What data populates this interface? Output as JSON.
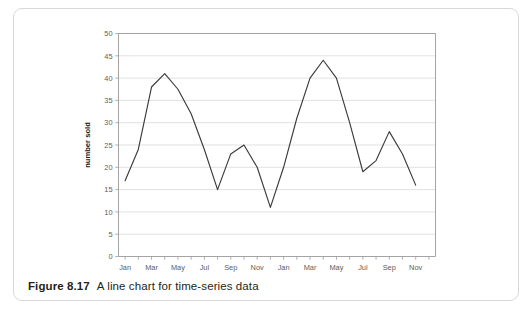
{
  "figure": {
    "caption_number": "Figure 8.17",
    "caption_text": "A line chart for time-series data"
  },
  "chart_data": {
    "type": "line",
    "title": "",
    "xlabel": "",
    "ylabel": "number sold",
    "ylim": [
      0,
      50
    ],
    "ytick_values": [
      0,
      5,
      10,
      15,
      20,
      25,
      30,
      35,
      40,
      45,
      50
    ],
    "ytick_labels": [
      "0",
      "5",
      "10",
      "15",
      "20",
      "25",
      "30",
      "35",
      "40",
      "45",
      "50"
    ],
    "grid": true,
    "grid_axis": "y",
    "legend": false,
    "legend_position": "none",
    "line_color": "#3b3b3b",
    "grid_color": "#d4d4d4",
    "axis_color": "#9a9a9a",
    "categories": [
      "Jan",
      "Feb",
      "Mar",
      "Apr",
      "May",
      "Jun",
      "Jul",
      "Aug",
      "Sep",
      "Oct",
      "Nov",
      "Dec",
      "Jan",
      "Feb",
      "Mar",
      "Apr",
      "May",
      "Jun",
      "Jul",
      "Aug",
      "Sep",
      "Oct",
      "Nov",
      "Dec"
    ],
    "xtick_labels_shown": [
      "Jan",
      "Mar",
      "May",
      "Jul",
      "Sep",
      "Nov",
      "Jan",
      "Mar",
      "May",
      "Jul",
      "Sep",
      "Nov"
    ],
    "xtick_label_step": 2,
    "values": [
      17,
      24,
      38,
      41,
      37.5,
      32,
      24,
      15,
      23,
      25,
      20,
      11,
      20,
      31,
      40,
      44,
      40,
      30,
      19,
      21.5,
      28,
      23,
      16,
      null
    ]
  }
}
